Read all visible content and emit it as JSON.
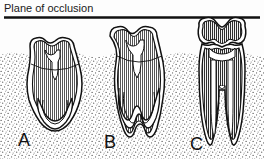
{
  "figure": {
    "title": "Plane of occlusion",
    "caption_label": "Plane of occlusion",
    "type": "dental-eruption-diagram",
    "background_color": "#fdfdfd",
    "ink_color": "#111111",
    "bone_color": "#555555",
    "enamel_fill": "#ffffff",
    "dentin_hatch_color": "#333333"
  },
  "occlusal_plane": {
    "label": "Plane of occlusion",
    "y": 17,
    "x_start": 4,
    "x_end": 260,
    "thickness": 2.4
  },
  "bone": {
    "label": "alveolar bone",
    "texture": "stipple",
    "crest_y": 55
  },
  "stages": [
    {
      "letter": "A",
      "label": "A",
      "description": "unerupted molar, incomplete roots, wide open apex",
      "center_x": 55,
      "crown_top_y": 38,
      "root_apex_y": 130,
      "eruption_state": "unerupted",
      "root_formation": "incomplete-open-apex",
      "distance_below_plane": 21
    },
    {
      "letter": "B",
      "label": "B",
      "description": "partially erupted molar, roots lengthening, apices narrowing",
      "center_x": 136,
      "crown_top_y": 27,
      "root_apex_y": 136,
      "eruption_state": "partially-erupted",
      "root_formation": "two-thirds-formed",
      "distance_below_plane": 10
    },
    {
      "letter": "C",
      "label": "C",
      "description": "fully erupted molar in occlusion, roots complete with closed apices",
      "center_x": 222,
      "crown_top_y": 18,
      "root_apex_y": 140,
      "eruption_state": "fully-erupted",
      "root_formation": "complete-closed-apex",
      "distance_below_plane": 0
    }
  ],
  "labels": {
    "a": "A",
    "b": "B",
    "c": "C"
  }
}
